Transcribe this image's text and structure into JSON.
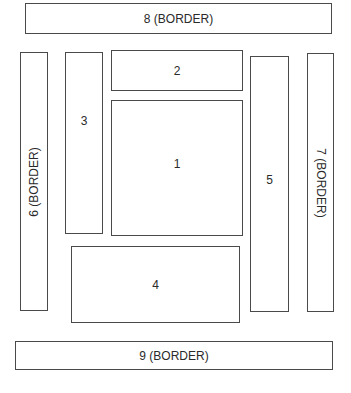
{
  "diagram": {
    "type": "layout-regions",
    "boxes": {
      "b1": {
        "id": 1,
        "label": "1",
        "role": "center"
      },
      "b2": {
        "id": 2,
        "label": "2",
        "role": "top"
      },
      "b3": {
        "id": 3,
        "label": "3",
        "role": "left"
      },
      "b4": {
        "id": 4,
        "label": "4",
        "role": "bottom"
      },
      "b5": {
        "id": 5,
        "label": "5",
        "role": "right"
      },
      "b6": {
        "id": 6,
        "label": "6 (BORDER)",
        "role": "left-border",
        "text_orientation": "vertical-bottom-to-top"
      },
      "b7": {
        "id": 7,
        "label": "7 (BORDER)",
        "role": "right-border",
        "text_orientation": "vertical-top-to-bottom"
      },
      "b8": {
        "id": 8,
        "label": "8 (BORDER)",
        "role": "top-border"
      },
      "b9": {
        "id": 9,
        "label": "9 (BORDER)",
        "role": "bottom-border"
      }
    },
    "colors": {
      "stroke": "#4a4a4a",
      "text": "#2a2a2a",
      "background": "#ffffff"
    }
  }
}
